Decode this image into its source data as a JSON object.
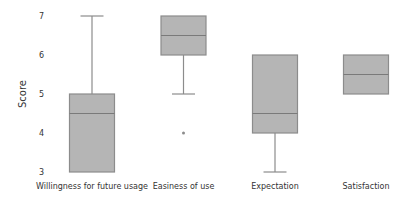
{
  "chart_data": {
    "type": "boxplot",
    "title": "",
    "xlabel": "",
    "ylabel": "Score",
    "ylim": [
      3,
      7
    ],
    "yticks": [
      3,
      4,
      5,
      6,
      7
    ],
    "grid": false,
    "legend": null,
    "categories": [
      "Willingness for future usage",
      "Easiness of use",
      "Expectation",
      "Satisfaction"
    ],
    "series": [
      {
        "name": "Willingness for future usage",
        "whisker_low": 3,
        "q1": 3,
        "median": 4.5,
        "q3": 5,
        "whisker_high": 7,
        "outliers": []
      },
      {
        "name": "Easiness of use",
        "whisker_low": 5,
        "q1": 6,
        "median": 6.5,
        "q3": 7,
        "whisker_high": 7,
        "outliers": [
          4
        ]
      },
      {
        "name": "Expectation",
        "whisker_low": 3,
        "q1": 4,
        "median": 4.5,
        "q3": 6,
        "whisker_high": 6,
        "outliers": []
      },
      {
        "name": "Satisfaction",
        "whisker_low": 5,
        "q1": 5,
        "median": 5.5,
        "q3": 6,
        "whisker_high": 6,
        "outliers": []
      }
    ],
    "colors": {
      "box_fill": "#b5b5b5",
      "box_stroke": "#8c8c8c",
      "text": "#333333"
    }
  }
}
